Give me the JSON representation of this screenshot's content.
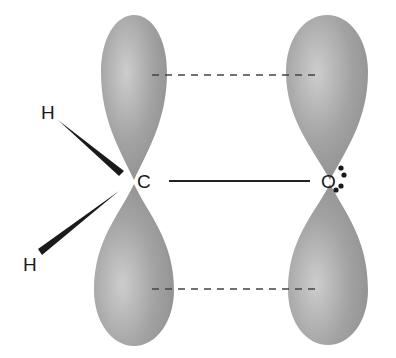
{
  "diagram": {
    "type": "pi-bond-orbital-diagram",
    "atoms": {
      "carbon": {
        "symbol": "C"
      },
      "oxygen": {
        "symbol": "O"
      },
      "hydrogen_top": {
        "symbol": "H"
      },
      "hydrogen_bottom": {
        "symbol": "H"
      }
    },
    "bonds": [
      {
        "from": "C",
        "to": "O",
        "kind": "sigma",
        "style": "solid line"
      },
      {
        "from": "C",
        "to": "H",
        "kind": "wedge"
      },
      {
        "from": "C",
        "to": "H",
        "kind": "wedge"
      }
    ],
    "orbitals": [
      {
        "atom": "C",
        "kind": "p",
        "lobes": [
          "upper",
          "lower"
        ]
      },
      {
        "atom": "O",
        "kind": "p",
        "lobes": [
          "upper",
          "lower"
        ]
      }
    ],
    "overlap_lines": [
      {
        "position": "upper",
        "style": "dashed"
      },
      {
        "position": "lower",
        "style": "dashed"
      }
    ],
    "lone_pairs_on_O": 2,
    "colors": {
      "lobe_fill": "#9a9a9a",
      "lobe_highlight": "#c8c8c8",
      "line": "#222222",
      "dash": "#444444"
    }
  }
}
